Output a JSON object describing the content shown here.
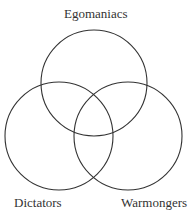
{
  "diagram": {
    "type": "venn",
    "sets": [
      {
        "label": "Egomaniacs",
        "position": "top"
      },
      {
        "label": "Dictators",
        "position": "bottom-left"
      },
      {
        "label": "Warmongers",
        "position": "bottom-right"
      }
    ],
    "stroke_color": "#333333",
    "background": "#ffffff"
  }
}
